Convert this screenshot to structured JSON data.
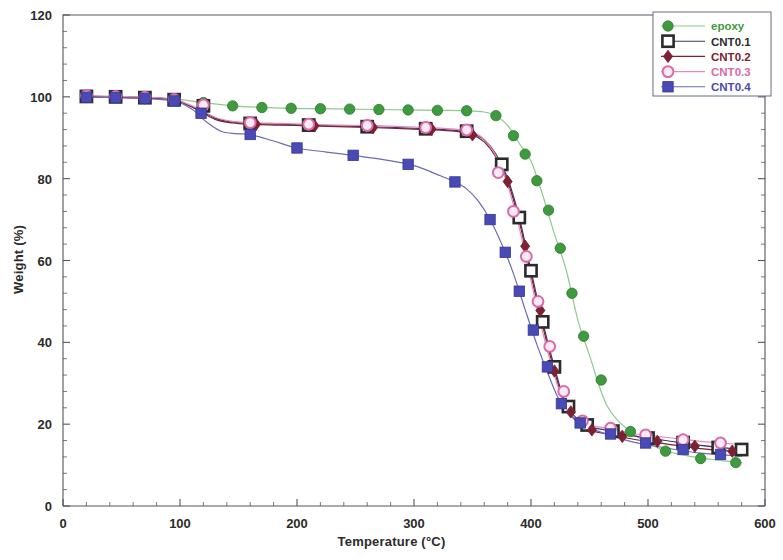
{
  "chart_data": {
    "type": "line",
    "title": "",
    "xlabel": "Temperature (°C)",
    "ylabel": "Weight (%)",
    "xlim": [
      0,
      600
    ],
    "ylim": [
      0,
      120
    ],
    "xticks": [
      0,
      100,
      200,
      300,
      400,
      500,
      600
    ],
    "yticks": [
      0,
      20,
      40,
      60,
      80,
      100,
      120
    ],
    "xminor_step": 20,
    "yminor_step": 4,
    "grid": false,
    "legend_position": "top-right",
    "series": [
      {
        "name": "epoxy",
        "color": "#3f9a3f",
        "line_color": "#8fc98f",
        "marker": "circle-filled",
        "x": [
          20,
          45,
          70,
          95,
          120,
          145,
          170,
          195,
          220,
          245,
          270,
          295,
          320,
          345,
          360,
          370,
          380,
          390,
          400,
          410,
          420,
          430,
          440,
          450,
          465,
          485,
          510,
          535,
          560,
          580
        ],
        "y": [
          100.2,
          100.0,
          99.9,
          99.5,
          98.6,
          97.8,
          97.4,
          97.2,
          97.1,
          97.0,
          96.9,
          96.8,
          96.7,
          96.6,
          96.3,
          95.4,
          93.0,
          88.6,
          84.3,
          76.0,
          66.5,
          57.8,
          45.5,
          36.8,
          24.5,
          18.2,
          14.0,
          12.2,
          11.2,
          10.6
        ],
        "markers_x": [
          20,
          45,
          70,
          95,
          120,
          145,
          170,
          195,
          220,
          245,
          270,
          295,
          320,
          345,
          370,
          385,
          395,
          405,
          415,
          425,
          435,
          445,
          460,
          485,
          515,
          545,
          575
        ],
        "markers_y": [
          100.2,
          100.0,
          99.9,
          99.5,
          98.6,
          97.8,
          97.4,
          97.2,
          97.1,
          97.0,
          96.9,
          96.8,
          96.7,
          96.6,
          95.4,
          90.5,
          86.0,
          79.5,
          72.3,
          63.0,
          52.0,
          41.5,
          30.8,
          18.2,
          13.4,
          11.6,
          10.6
        ]
      },
      {
        "name": "CNT0.1",
        "color": "#2b2b2b",
        "line_color": "#3a3a6e",
        "marker": "square-open",
        "x": [
          20,
          45,
          70,
          95,
          115,
          130,
          145,
          160,
          185,
          210,
          235,
          260,
          285,
          310,
          335,
          350,
          360,
          370,
          380,
          390,
          400,
          410,
          420,
          430,
          445,
          465,
          490,
          515,
          545,
          580
        ],
        "y": [
          100.1,
          100.0,
          99.8,
          99.3,
          97.0,
          94.8,
          93.8,
          93.5,
          93.3,
          93.1,
          92.9,
          92.7,
          92.5,
          92.2,
          91.8,
          91.0,
          89.5,
          86.0,
          80.1,
          70.5,
          57.5,
          45.0,
          34.0,
          25.0,
          20.0,
          18.5,
          17.0,
          16.0,
          14.8,
          13.8
        ],
        "markers_x": [
          20,
          45,
          70,
          95,
          120,
          160,
          210,
          260,
          310,
          345,
          375,
          390,
          400,
          410,
          420,
          432,
          448,
          470,
          500,
          530,
          560,
          580
        ],
        "markers_y": [
          100.1,
          100.0,
          99.8,
          99.3,
          97.8,
          93.5,
          93.1,
          92.7,
          92.2,
          91.6,
          83.5,
          70.5,
          57.5,
          45.0,
          34.0,
          24.3,
          19.8,
          18.3,
          16.6,
          15.5,
          14.3,
          13.8
        ]
      },
      {
        "name": "CNT0.2",
        "color": "#7b2132",
        "line_color": "#7b2132",
        "marker": "diamond-filled",
        "x": [
          20,
          45,
          70,
          95,
          115,
          130,
          145,
          160,
          185,
          210,
          235,
          260,
          285,
          310,
          335,
          350,
          360,
          370,
          380,
          390,
          400,
          410,
          420,
          430,
          445,
          465,
          490,
          515,
          545,
          580
        ],
        "y": [
          100.0,
          99.9,
          99.7,
          99.2,
          96.8,
          94.5,
          93.6,
          93.3,
          93.1,
          92.9,
          92.7,
          92.5,
          92.3,
          92.0,
          91.6,
          90.7,
          89.0,
          85.3,
          79.3,
          69.5,
          56.5,
          44.0,
          33.0,
          24.2,
          19.2,
          17.6,
          16.2,
          15.2,
          14.0,
          13.2
        ],
        "markers_x": [
          20,
          70,
          120,
          165,
          215,
          265,
          315,
          350,
          380,
          395,
          408,
          420,
          434,
          452,
          478,
          508,
          540,
          572
        ],
        "markers_y": [
          100.0,
          99.7,
          97.5,
          93.3,
          92.9,
          92.5,
          92.1,
          90.7,
          79.3,
          63.5,
          47.8,
          33.0,
          23.0,
          18.6,
          17.0,
          15.8,
          14.6,
          13.4
        ]
      },
      {
        "name": "CNT0.3",
        "color": "#d96ba8",
        "line_color": "#e58ab8",
        "marker": "circle-open",
        "x": [
          20,
          45,
          70,
          95,
          115,
          130,
          145,
          160,
          185,
          210,
          235,
          260,
          285,
          310,
          335,
          350,
          360,
          370,
          380,
          390,
          400,
          410,
          420,
          430,
          445,
          465,
          490,
          515,
          545,
          580
        ],
        "y": [
          100.3,
          100.1,
          99.9,
          99.4,
          97.2,
          95.0,
          94.0,
          93.7,
          93.5,
          93.3,
          93.1,
          93.0,
          92.8,
          92.5,
          92.1,
          91.3,
          89.6,
          85.6,
          78.5,
          68.0,
          55.0,
          42.5,
          32.0,
          24.0,
          20.2,
          19.0,
          17.6,
          16.8,
          15.8,
          15.0
        ],
        "markers_x": [
          20,
          45,
          70,
          95,
          120,
          160,
          210,
          260,
          310,
          345,
          372,
          385,
          396,
          406,
          416,
          428,
          444,
          468,
          498,
          530,
          562
        ],
        "markers_y": [
          100.3,
          100.1,
          99.9,
          99.4,
          98.0,
          93.7,
          93.3,
          93.0,
          92.5,
          91.9,
          81.5,
          72.0,
          61.0,
          50.0,
          39.0,
          28.0,
          20.8,
          19.0,
          17.4,
          16.2,
          15.4
        ]
      },
      {
        "name": "CNT0.4",
        "color": "#4a4ab4",
        "line_color": "#6a6ab8",
        "marker": "square-filled",
        "x": [
          20,
          45,
          70,
          95,
          110,
          122,
          135,
          148,
          160,
          180,
          200,
          225,
          250,
          275,
          300,
          320,
          335,
          345,
          355,
          365,
          375,
          385,
          395,
          405,
          415,
          425,
          440,
          460,
          485,
          515,
          545,
          580
        ],
        "y": [
          99.9,
          99.8,
          99.6,
          99.0,
          97.0,
          94.0,
          91.6,
          91.0,
          90.8,
          89.2,
          87.5,
          86.5,
          85.6,
          84.6,
          83.2,
          81.0,
          79.2,
          77.5,
          74.5,
          70.0,
          64.0,
          56.8,
          48.0,
          39.5,
          32.0,
          25.5,
          20.5,
          18.0,
          15.8,
          14.2,
          12.9,
          12.2
        ],
        "markers_x": [
          20,
          45,
          70,
          95,
          118,
          160,
          200,
          248,
          295,
          335,
          365,
          378,
          390,
          402,
          414,
          426,
          442,
          468,
          498,
          530,
          562
        ],
        "markers_y": [
          99.9,
          99.8,
          99.6,
          99.0,
          96.0,
          90.8,
          87.5,
          85.7,
          83.5,
          79.2,
          70.0,
          62.0,
          52.5,
          43.0,
          34.0,
          25.0,
          20.3,
          17.6,
          15.4,
          13.8,
          12.6
        ]
      }
    ]
  },
  "legend": {
    "items": [
      {
        "label": "epoxy"
      },
      {
        "label": "CNT0.1"
      },
      {
        "label": "CNT0.2"
      },
      {
        "label": "CNT0.3"
      },
      {
        "label": "CNT0.4"
      }
    ]
  },
  "axes": {
    "x_tick_labels": [
      "0",
      "100",
      "200",
      "300",
      "400",
      "500",
      "600"
    ],
    "y_tick_labels": [
      "0",
      "20",
      "40",
      "60",
      "80",
      "100",
      "120"
    ]
  }
}
